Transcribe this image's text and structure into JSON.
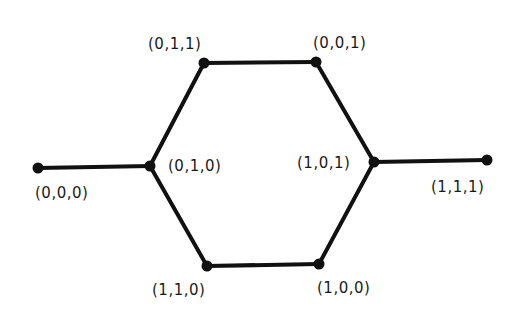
{
  "diagram": {
    "type": "graph",
    "edge_color": "#111111",
    "node_color": "#111111",
    "nodes": [
      {
        "id": "000",
        "label": "(0,0,0)",
        "x": 38,
        "y": 168,
        "lx": 35,
        "ly": 186
      },
      {
        "id": "010",
        "label": "(0,1,0)",
        "x": 150,
        "y": 166,
        "lx": 168,
        "ly": 159
      },
      {
        "id": "011",
        "label": "(0,1,1)",
        "x": 204,
        "y": 63,
        "lx": 148,
        "ly": 37
      },
      {
        "id": "001",
        "label": "(0,0,1)",
        "x": 316,
        "y": 62,
        "lx": 313,
        "ly": 36
      },
      {
        "id": "101",
        "label": "(1,0,1)",
        "x": 374,
        "y": 162,
        "lx": 297,
        "ly": 156
      },
      {
        "id": "111",
        "label": "(1,1,1)",
        "x": 487,
        "y": 160,
        "lx": 431,
        "ly": 180
      },
      {
        "id": "110",
        "label": "(1,1,0)",
        "x": 207,
        "y": 266,
        "lx": 152,
        "ly": 283
      },
      {
        "id": "100",
        "label": "(1,0,0)",
        "x": 319,
        "y": 264,
        "lx": 317,
        "ly": 281
      }
    ],
    "edges": [
      [
        "000",
        "010"
      ],
      [
        "010",
        "011"
      ],
      [
        "011",
        "001"
      ],
      [
        "001",
        "101"
      ],
      [
        "101",
        "111"
      ],
      [
        "010",
        "110"
      ],
      [
        "110",
        "100"
      ],
      [
        "100",
        "101"
      ]
    ]
  }
}
